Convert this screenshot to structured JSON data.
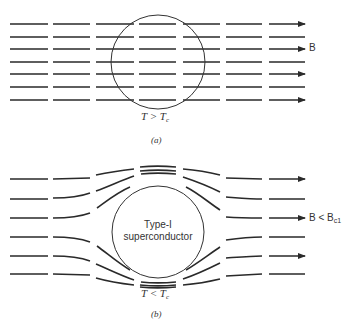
{
  "figure_a": {
    "field_label": "B",
    "temperature_label": "T > T",
    "temperature_sub": "c",
    "caption": "(a)"
  },
  "figure_b": {
    "material_label_line1": "Type-I",
    "material_label_line2": "superconductor",
    "field_label": "B < B",
    "field_sub": "c1",
    "temperature_label": "T < T",
    "temperature_sub": "c",
    "caption": "(b)"
  },
  "colors": {
    "line": "#2a2a2a",
    "background": "#ffffff"
  }
}
